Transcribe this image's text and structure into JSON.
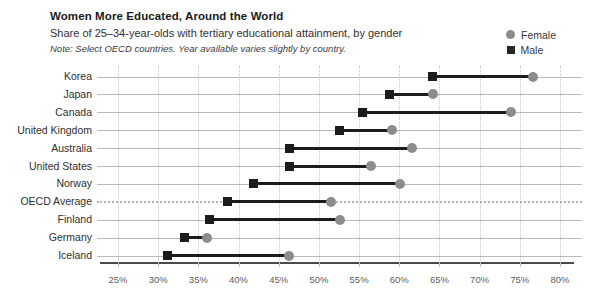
{
  "header": {
    "title": "Women More Educated, Around the World",
    "subtitle": "Share of 25–34-year-olds with tertiary educational attainment, by gender",
    "note": "Note: Select OECD countries. Year available varies slightly by country."
  },
  "legend": {
    "position": "top-right",
    "entries": [
      {
        "label": "Female",
        "marker": "circle",
        "color": "#8a8a8a",
        "icon": "female-circle-icon"
      },
      {
        "label": "Male",
        "marker": "square",
        "color": "#262626",
        "icon": "male-square-icon"
      }
    ]
  },
  "colors": {
    "male": "#1c1c1c",
    "female": "#8d8d8d",
    "gridline": "#c9c9c9",
    "axis": "#4b4b4b",
    "baseline": "#b9b9b9",
    "text": "#2f2f2f"
  },
  "chart_data": {
    "type": "scatter",
    "subtype": "dumbbell",
    "title": "Women More Educated, Around the World",
    "subtitle": "Share of 25–34-year-olds with tertiary educational attainment, by gender",
    "note": "Note: Select OECD countries. Year available varies slightly by country.",
    "xlabel": "",
    "ylabel": "",
    "xlim": [
      25,
      80
    ],
    "xticks": [
      25,
      30,
      35,
      40,
      45,
      50,
      55,
      60,
      65,
      70,
      75,
      80
    ],
    "xtick_labels": [
      "25%",
      "30%",
      "35%",
      "40%",
      "45%",
      "50%",
      "55%",
      "60%",
      "65%",
      "70%",
      "75%",
      "80%"
    ],
    "grid": "vertical-dotted",
    "legend_position": "top-right",
    "categories": [
      "Korea",
      "Japan",
      "Canada",
      "United Kingdom",
      "Australia",
      "United States",
      "Norway",
      "OECD Average",
      "Finland",
      "Germany",
      "Iceland"
    ],
    "series": [
      {
        "name": "Male",
        "marker": "square",
        "color": "#1c1c1c",
        "values": [
          64.1,
          58.8,
          55.4,
          52.5,
          46.4,
          46.4,
          41.8,
          38.6,
          36.4,
          33.3,
          31.1
        ]
      },
      {
        "name": "Female",
        "marker": "circle",
        "color": "#8d8d8d",
        "values": [
          76.6,
          64.2,
          73.9,
          59.1,
          61.6,
          56.5,
          60.1,
          51.5,
          52.6,
          36.1,
          46.3
        ]
      }
    ],
    "highlight_row": "OECD Average"
  },
  "rows": [
    {
      "label": "Korea",
      "male": 64.1,
      "female": 76.6,
      "dashed": false
    },
    {
      "label": "Japan",
      "male": 58.8,
      "female": 64.2,
      "dashed": false
    },
    {
      "label": "Canada",
      "male": 55.4,
      "female": 73.9,
      "dashed": false
    },
    {
      "label": "United Kingdom",
      "male": 52.5,
      "female": 59.1,
      "dashed": false
    },
    {
      "label": "Australia",
      "male": 46.4,
      "female": 61.6,
      "dashed": false
    },
    {
      "label": "United States",
      "male": 46.4,
      "female": 56.5,
      "dashed": false
    },
    {
      "label": "Norway",
      "male": 41.8,
      "female": 60.1,
      "dashed": false
    },
    {
      "label": "OECD Average",
      "male": 38.6,
      "female": 51.5,
      "dashed": true
    },
    {
      "label": "Finland",
      "male": 36.4,
      "female": 52.6,
      "dashed": false
    },
    {
      "label": "Germany",
      "male": 33.3,
      "female": 36.1,
      "dashed": false
    },
    {
      "label": "Iceland",
      "male": 31.1,
      "female": 46.3,
      "dashed": false
    }
  ]
}
